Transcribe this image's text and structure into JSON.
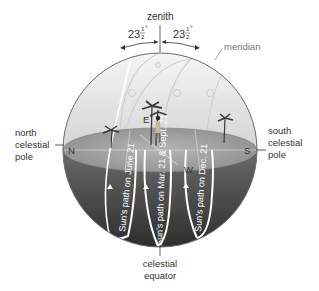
{
  "diagram": {
    "zenith_label": "zenith",
    "angle_left": {
      "whole": "23",
      "num": "1",
      "den": "2",
      "deg": "°"
    },
    "angle_right": {
      "whole": "23",
      "num": "1",
      "den": "2",
      "deg": "°"
    },
    "meridian_label": "meridian",
    "north_pole_label": [
      "north",
      "celestial",
      "pole"
    ],
    "south_pole_label": [
      "south",
      "celestial",
      "pole"
    ],
    "equator_label": [
      "celestial",
      "equator"
    ],
    "compass": {
      "N": "N",
      "S": "S",
      "E": "E",
      "W": "W"
    },
    "paths": [
      {
        "name": "june",
        "label": "Sun's path on June 21"
      },
      {
        "name": "equinox",
        "label": "Sun's path on Mar. 21 & Sept. 21"
      },
      {
        "name": "december",
        "label": "Sun's path on Dec. 21"
      }
    ],
    "colors": {
      "sky_top": "#f4f4f4",
      "sky_bottom": "#d8d8d8",
      "horizon_plane": "#9a9a9a",
      "underground_top": "#5a5a5a",
      "underground_bottom": "#2e2e2e",
      "path_line": "#ffffff",
      "outline": "#555555"
    }
  }
}
